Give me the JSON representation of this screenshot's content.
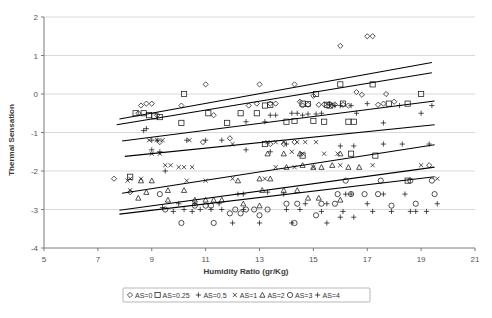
{
  "chart_data": {
    "type": "scatter",
    "title": "",
    "xlabel": "Humidity Ratio (gr/Kg)",
    "ylabel": "Thermal Sensation",
    "xlim": [
      5,
      21
    ],
    "ylim": [
      -4,
      2
    ],
    "xticks": [
      5,
      7,
      9,
      11,
      13,
      15,
      17,
      19,
      21
    ],
    "yticks": [
      2,
      1,
      0,
      -1,
      -2,
      -3,
      -4
    ],
    "grid": true,
    "legend_position": "bottom",
    "legend": [
      {
        "label": "AS=0",
        "marker": "diamond"
      },
      {
        "label": "AS=0.25",
        "marker": "square"
      },
      {
        "label": "AS=0.5",
        "marker": "plus"
      },
      {
        "label": "AS=1",
        "marker": "cross"
      },
      {
        "label": "AS=2",
        "marker": "triangle"
      },
      {
        "label": "AS=3",
        "marker": "circle"
      },
      {
        "label": "AS=4",
        "marker": "plus"
      }
    ],
    "series": [
      {
        "name": "AS=0",
        "marker": "diamond",
        "points": [
          [
            8.5,
            -0.5
          ],
          [
            8.6,
            -0.3
          ],
          [
            8.8,
            -0.25
          ],
          [
            9.0,
            -0.25
          ],
          [
            9.2,
            -0.55
          ],
          [
            10.1,
            -0.3
          ],
          [
            11.0,
            0.25
          ],
          [
            11.3,
            -0.55
          ],
          [
            11.9,
            -1.15
          ],
          [
            12.6,
            -0.3
          ],
          [
            12.9,
            -0.25
          ],
          [
            13.0,
            0.25
          ],
          [
            13.4,
            -0.25
          ],
          [
            13.6,
            -0.25
          ],
          [
            14.3,
            0.25
          ],
          [
            14.5,
            -0.2
          ],
          [
            14.6,
            -0.3
          ],
          [
            14.8,
            -0.28
          ],
          [
            15.0,
            -0.05
          ],
          [
            15.2,
            -0.28
          ],
          [
            15.4,
            -0.27
          ],
          [
            15.6,
            -0.25
          ],
          [
            15.7,
            -0.3
          ],
          [
            15.8,
            -0.27
          ],
          [
            16.0,
            1.25
          ],
          [
            16.1,
            -0.28
          ],
          [
            16.3,
            -0.3
          ],
          [
            16.6,
            0.05
          ],
          [
            16.8,
            -0.02
          ],
          [
            17.0,
            1.5
          ],
          [
            17.2,
            1.5
          ],
          [
            17.4,
            -0.28
          ],
          [
            17.6,
            -0.25
          ],
          [
            7.6,
            -2.2
          ],
          [
            8.2,
            -2.55
          ],
          [
            9.3,
            -1.25
          ],
          [
            10.9,
            -1.25
          ],
          [
            13.4,
            -1.3
          ],
          [
            13.9,
            -1.3
          ],
          [
            14.3,
            -1.25
          ],
          [
            17.7,
            0.0
          ],
          [
            18.0,
            -0.2
          ],
          [
            19.3,
            -1.85
          ]
        ]
      },
      {
        "name": "AS=0.25",
        "marker": "square",
        "points": [
          [
            8.4,
            -0.5
          ],
          [
            8.7,
            -0.5
          ],
          [
            8.9,
            -0.55
          ],
          [
            9.1,
            -0.58
          ],
          [
            9.3,
            -0.6
          ],
          [
            10.1,
            -0.75
          ],
          [
            10.2,
            0.0
          ],
          [
            11.1,
            -0.5
          ],
          [
            11.8,
            -0.75
          ],
          [
            12.3,
            -0.5
          ],
          [
            12.9,
            -0.5
          ],
          [
            13.2,
            -0.3
          ],
          [
            13.4,
            -0.28
          ],
          [
            14.0,
            -0.72
          ],
          [
            14.3,
            -0.7
          ],
          [
            14.6,
            -0.25
          ],
          [
            14.8,
            -0.26
          ],
          [
            15.0,
            -0.7
          ],
          [
            15.1,
            0.0
          ],
          [
            15.4,
            -0.72
          ],
          [
            15.5,
            -0.28
          ],
          [
            15.6,
            -0.3
          ],
          [
            16.0,
            0.25
          ],
          [
            16.1,
            -0.25
          ],
          [
            16.3,
            -0.72
          ],
          [
            16.5,
            -0.72
          ],
          [
            17.2,
            0.25
          ],
          [
            17.8,
            -0.25
          ],
          [
            18.5,
            -0.25
          ],
          [
            19.0,
            0.0
          ],
          [
            8.2,
            -2.15
          ],
          [
            13.2,
            -1.3
          ],
          [
            14.6,
            -1.6
          ],
          [
            16.4,
            -1.55
          ],
          [
            17.3,
            -1.6
          ],
          [
            18.5,
            -2.25
          ]
        ]
      },
      {
        "name": "AS=0.5",
        "marker": "plus",
        "points": [
          [
            8.7,
            -0.95
          ],
          [
            8.8,
            -0.9
          ],
          [
            9.0,
            -1.2
          ],
          [
            9.2,
            -1.2
          ],
          [
            10.3,
            -1.2
          ],
          [
            11.0,
            -1.2
          ],
          [
            11.6,
            -1.2
          ],
          [
            12.5,
            -0.72
          ],
          [
            13.2,
            -0.72
          ],
          [
            13.4,
            -0.55
          ],
          [
            13.6,
            -0.55
          ],
          [
            14.2,
            -0.5
          ],
          [
            14.4,
            -0.5
          ],
          [
            14.6,
            -0.55
          ],
          [
            14.8,
            -0.52
          ],
          [
            15.1,
            -0.52
          ],
          [
            15.3,
            -0.5
          ],
          [
            15.6,
            -0.28
          ],
          [
            15.8,
            -0.3
          ],
          [
            16.0,
            -0.3
          ],
          [
            16.4,
            -0.3
          ],
          [
            16.6,
            -0.5
          ],
          [
            17.0,
            -0.25
          ],
          [
            17.6,
            -0.75
          ],
          [
            18.2,
            -0.3
          ],
          [
            19.0,
            -0.5
          ],
          [
            19.4,
            -0.3
          ],
          [
            9.0,
            -1.45
          ],
          [
            9.3,
            -1.5
          ],
          [
            9.5,
            -2.0
          ],
          [
            12.5,
            -1.45
          ],
          [
            13.4,
            -1.5
          ],
          [
            14.0,
            -1.3
          ],
          [
            16.0,
            -1.35
          ],
          [
            16.5,
            -1.35
          ],
          [
            17.6,
            -1.3
          ],
          [
            18.3,
            -1.3
          ],
          [
            19.3,
            -1.3
          ],
          [
            10.0,
            -2.85
          ],
          [
            10.6,
            -2.85
          ],
          [
            11.5,
            -2.85
          ],
          [
            12.2,
            -2.6
          ],
          [
            12.4,
            -2.6
          ],
          [
            13.3,
            -2.55
          ],
          [
            13.9,
            -2.6
          ],
          [
            14.7,
            -2.85
          ],
          [
            15.5,
            -2.85
          ],
          [
            16.2,
            -2.6
          ],
          [
            16.4,
            -2.6
          ],
          [
            17.0,
            -2.85
          ],
          [
            17.6,
            -2.6
          ],
          [
            18.4,
            -2.6
          ],
          [
            19.6,
            -2.85
          ],
          [
            9.4,
            -2.95
          ],
          [
            10.2,
            -3.0
          ],
          [
            10.8,
            -3.0
          ],
          [
            11.2,
            -3.0
          ],
          [
            11.6,
            -3.0
          ],
          [
            12.4,
            -3.0
          ],
          [
            14.0,
            -3.0
          ],
          [
            14.5,
            -3.0
          ],
          [
            15.3,
            -3.05
          ],
          [
            16.1,
            -3.05
          ],
          [
            18.8,
            -3.05
          ]
        ]
      },
      {
        "name": "AS=1",
        "marker": "cross",
        "points": [
          [
            8.9,
            -1.2
          ],
          [
            9.2,
            -1.2
          ],
          [
            9.4,
            -1.2
          ],
          [
            10.4,
            -1.2
          ],
          [
            9.0,
            -1.55
          ],
          [
            9.3,
            -1.55
          ],
          [
            9.5,
            -1.85
          ],
          [
            9.7,
            -1.85
          ],
          [
            10.0,
            -1.9
          ],
          [
            10.2,
            -1.9
          ],
          [
            10.5,
            -1.9
          ],
          [
            8.1,
            -2.25
          ],
          [
            8.2,
            -2.5
          ],
          [
            12.0,
            -1.3
          ],
          [
            13.3,
            -1.25
          ],
          [
            13.6,
            -1.25
          ],
          [
            13.9,
            -1.25
          ],
          [
            14.4,
            -1.25
          ],
          [
            14.7,
            -1.25
          ],
          [
            15.1,
            -1.25
          ],
          [
            14.2,
            -1.5
          ],
          [
            14.6,
            -1.55
          ],
          [
            15.4,
            -1.55
          ],
          [
            15.9,
            -1.55
          ],
          [
            13.6,
            -1.9
          ],
          [
            14.3,
            -1.9
          ],
          [
            15.0,
            -1.9
          ],
          [
            16.0,
            -1.85
          ],
          [
            17.2,
            -1.85
          ],
          [
            19.0,
            -1.85
          ],
          [
            19.6,
            -2.2
          ],
          [
            11.0,
            -2.25
          ],
          [
            12.0,
            -2.2
          ],
          [
            13.2,
            -2.2
          ],
          [
            8.2,
            -2.2
          ],
          [
            8.6,
            -2.2
          ],
          [
            10.3,
            -2.25
          ]
        ]
      },
      {
        "name": "AS=2",
        "marker": "triangle",
        "points": [
          [
            8.6,
            -2.25
          ],
          [
            9.0,
            -2.25
          ],
          [
            9.6,
            -2.5
          ],
          [
            10.2,
            -2.5
          ],
          [
            8.8,
            -2.55
          ],
          [
            8.5,
            -2.7
          ],
          [
            9.6,
            -2.75
          ],
          [
            10.6,
            -2.75
          ],
          [
            11.0,
            -2.75
          ],
          [
            11.3,
            -2.75
          ],
          [
            12.2,
            -2.25
          ],
          [
            13.0,
            -2.2
          ],
          [
            13.4,
            -2.2
          ],
          [
            13.1,
            -2.5
          ],
          [
            13.9,
            -2.5
          ],
          [
            14.4,
            -2.5
          ],
          [
            14.0,
            -1.9
          ],
          [
            14.6,
            -1.85
          ],
          [
            15.0,
            -1.9
          ],
          [
            15.3,
            -1.9
          ],
          [
            15.7,
            -1.85
          ],
          [
            16.3,
            -1.9
          ],
          [
            16.7,
            -1.9
          ],
          [
            13.3,
            -1.55
          ],
          [
            13.9,
            -1.55
          ],
          [
            14.5,
            -1.55
          ],
          [
            16.0,
            -1.55
          ],
          [
            11.6,
            -2.75
          ],
          [
            14.8,
            -2.7
          ],
          [
            15.2,
            -2.7
          ],
          [
            16.0,
            -2.75
          ],
          [
            12.4,
            -2.85
          ],
          [
            13.0,
            -2.9
          ]
        ]
      },
      {
        "name": "AS=3",
        "marker": "circle",
        "points": [
          [
            9.3,
            -2.6
          ],
          [
            10.6,
            -2.9
          ],
          [
            11.0,
            -2.9
          ],
          [
            11.2,
            -2.9
          ],
          [
            12.1,
            -3.0
          ],
          [
            12.5,
            -3.0
          ],
          [
            12.8,
            -3.0
          ],
          [
            13.3,
            -3.0
          ],
          [
            14.0,
            -2.85
          ],
          [
            14.4,
            -2.85
          ],
          [
            15.3,
            -2.85
          ],
          [
            15.8,
            -2.85
          ],
          [
            15.9,
            -2.6
          ],
          [
            16.4,
            -2.6
          ],
          [
            16.9,
            -2.6
          ],
          [
            17.4,
            -2.6
          ],
          [
            16.2,
            -2.25
          ],
          [
            17.5,
            -2.25
          ],
          [
            18.6,
            -2.25
          ],
          [
            19.4,
            -2.25
          ],
          [
            11.9,
            -3.1
          ],
          [
            12.3,
            -3.1
          ],
          [
            13.0,
            -3.15
          ],
          [
            15.1,
            -3.15
          ],
          [
            9.5,
            -3.0
          ],
          [
            10.1,
            -3.35
          ],
          [
            11.3,
            -3.35
          ],
          [
            14.3,
            -3.35
          ],
          [
            17.9,
            -2.9
          ],
          [
            18.8,
            -2.85
          ],
          [
            19.5,
            -2.6
          ]
        ]
      },
      {
        "name": "AS=4",
        "marker": "plus",
        "points": [
          [
            9.8,
            -3.05
          ],
          [
            10.5,
            -3.05
          ],
          [
            12.0,
            -3.35
          ],
          [
            13.0,
            -3.35
          ],
          [
            14.2,
            -3.35
          ],
          [
            15.5,
            -3.35
          ],
          [
            16.0,
            -3.2
          ],
          [
            16.5,
            -3.2
          ],
          [
            17.2,
            -3.05
          ],
          [
            17.9,
            -3.05
          ],
          [
            18.6,
            -3.05
          ],
          [
            19.2,
            -3.05
          ]
        ]
      }
    ],
    "trendlines": [
      {
        "name": "AS=0 fit",
        "x0": 7.8,
        "y0": -0.65,
        "x1": 19.4,
        "y1": 0.82
      },
      {
        "name": "AS=0.25 fit",
        "x0": 7.7,
        "y0": -0.8,
        "x1": 19.4,
        "y1": 0.55
      },
      {
        "name": "AS=0.5 fit",
        "x0": 7.9,
        "y0": -1.22,
        "x1": 19.5,
        "y1": -0.18
      },
      {
        "name": "AS=1 fit",
        "x0": 8.0,
        "y0": -1.62,
        "x1": 19.5,
        "y1": -0.8
      },
      {
        "name": "AS=2 fit",
        "x0": 7.9,
        "y0": -2.58,
        "x1": 19.5,
        "y1": -1.32
      },
      {
        "name": "AS=3 fit",
        "x0": 7.8,
        "y0": -3.02,
        "x1": 19.5,
        "y1": -1.9
      },
      {
        "name": "AS=4 fit",
        "x0": 7.8,
        "y0": -3.12,
        "x1": 19.5,
        "y1": -2.15
      }
    ]
  }
}
